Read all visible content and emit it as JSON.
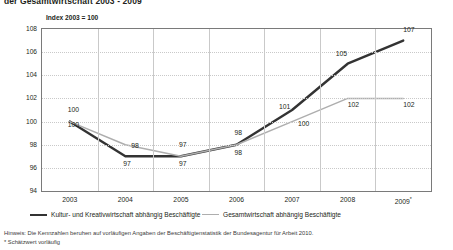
{
  "title": "der Gesamtwirtschaft 2003 - 2009",
  "axis_note": "Index 2003 = 100",
  "legend": {
    "position": "bottom",
    "items": [
      {
        "label": "Kultur- und Kreativwirtschaft abhängig Beschäftigte",
        "color": "#333333",
        "style": "thick"
      },
      {
        "label": "Gesamtwirtschaft abhängig Beschäftigte",
        "color": "#aeaeae",
        "style": "thin"
      }
    ]
  },
  "footnotes": [
    "Hinweis: Die Kennzahlen beruhen auf vorläufigen Angaben der Beschäftigtenstatistik der Bundesagentur für Arbeit 2010.",
    "* Schätzwert vorläufig"
  ],
  "yticks": [
    "108",
    "106",
    "104",
    "102",
    "100",
    "98",
    "96",
    "94"
  ],
  "xticks": [
    "2003",
    "2004",
    "2005",
    "2006",
    "2007",
    "2008",
    "2009*"
  ],
  "chart_data": {
    "type": "line",
    "title": "der Gesamtwirtschaft 2003 - 2009",
    "subtitle": "Index 2003 = 100",
    "xlabel": "",
    "ylabel": "Index 2003 = 100",
    "categories": [
      "2003",
      "2004",
      "2005",
      "2006",
      "2007",
      "2008",
      "2009*"
    ],
    "ylim": [
      94,
      108
    ],
    "ytick_step": 2,
    "grid": "both",
    "legend_position": "bottom",
    "series": [
      {
        "name": "Kultur- und Kreativwirtschaft abhängig Beschäftigte",
        "color": "#333333",
        "values": [
          100,
          97,
          97,
          98,
          101,
          105,
          107
        ],
        "labels": [
          "100",
          "97",
          "97",
          "98",
          "101",
          "105",
          "107"
        ]
      },
      {
        "name": "Gesamtwirtschaft abhängig Beschäftigte",
        "color": "#aeaeae",
        "values": [
          100,
          98,
          97,
          98,
          100,
          102,
          102
        ],
        "labels": [
          "100",
          "98",
          "97",
          "98",
          "100",
          "102",
          "102"
        ]
      }
    ],
    "annotations": [
      "Hinweis: Die Kennzahlen beruhen auf vorläufigen Angaben der Beschäftigtenstatistik der Bundesagentur für Arbeit 2010.",
      "* Schätzwert vorläufig"
    ]
  }
}
